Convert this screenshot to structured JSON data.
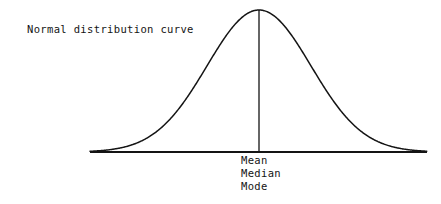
{
  "figure": {
    "title": "Normal distribution curve",
    "center_labels": [
      "Mean",
      "Median",
      "Mode"
    ],
    "ink_color": "#141414",
    "background_color": "#ffffff"
  },
  "chart_data": {
    "type": "line",
    "title": "Normal distribution curve",
    "subtitle": "",
    "xlabel": "",
    "ylabel": "",
    "grid": false,
    "legend": null,
    "axis": {
      "baseline_y_px": 152,
      "x_start_px": 90,
      "x_end_px": 427,
      "axis_line_visible": true,
      "ticks": [],
      "tick_labels": []
    },
    "annotations": [
      {
        "text": "Mean",
        "x_px": 241,
        "y_px": 158,
        "anchor": "start"
      },
      {
        "text": "Median",
        "x_px": 241,
        "y_px": 171,
        "anchor": "start"
      },
      {
        "text": "Mode",
        "x_px": 241,
        "y_px": 184,
        "anchor": "start"
      },
      {
        "text": "Normal distribution curve",
        "x_px": 27,
        "y_px": 32,
        "anchor": "start"
      }
    ],
    "series": [
      {
        "name": "normal-pdf",
        "mean": 0,
        "sd": 1,
        "peak_x_px": 259,
        "peak_y_px": 10,
        "amplitude_px": 142,
        "sd_px": 52,
        "x": [
          -3.25,
          -3.0,
          -2.75,
          -2.5,
          -2.25,
          -2.0,
          -1.75,
          -1.5,
          -1.25,
          -1.0,
          -0.75,
          -0.5,
          -0.25,
          0,
          0.25,
          0.5,
          0.75,
          1.0,
          1.25,
          1.5,
          1.75,
          2.0,
          2.25,
          2.5,
          2.75,
          3.0,
          3.25
        ],
        "values": [
          0.002,
          0.0044,
          0.0091,
          0.0175,
          0.0317,
          0.054,
          0.0863,
          0.1295,
          0.1826,
          0.242,
          0.3011,
          0.3521,
          0.3867,
          0.3989,
          0.3867,
          0.3521,
          0.3011,
          0.242,
          0.1826,
          0.1295,
          0.0863,
          0.054,
          0.0317,
          0.0175,
          0.0091,
          0.0044,
          0.002
        ]
      }
    ],
    "markers": [
      {
        "name": "mean-median-mode-line",
        "type": "vline",
        "x": 0,
        "x_px": 259,
        "from_y_px": 10,
        "to_y_px": 152
      }
    ],
    "xlim": [
      -3.35,
      3.35
    ],
    "ylim": [
      0,
      0.3989
    ]
  }
}
